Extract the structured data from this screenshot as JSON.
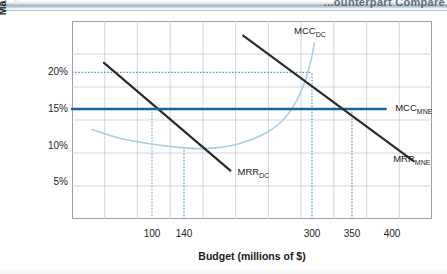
{
  "page": {
    "header_text": "...ounterpart Compare"
  },
  "chart_data": {
    "type": "line",
    "title": "",
    "xlabel": "Budget (millions of $)",
    "ylabel": "Marginal cost of capital\nand rate of return (percentage)",
    "xlim": [
      0,
      450
    ],
    "ylim": [
      0,
      27
    ],
    "grid": true,
    "legend_position": "inline-labels",
    "x_ticks": [
      {
        "label": "100",
        "value": 100
      },
      {
        "label": "140",
        "value": 140
      },
      {
        "label": "300",
        "value": 300
      },
      {
        "label": "350",
        "value": 350
      },
      {
        "label": "400",
        "value": 400
      }
    ],
    "y_ticks": [
      {
        "label": "20%",
        "value": 20
      },
      {
        "label": "15%",
        "value": 15
      },
      {
        "label": "10%",
        "value": 10
      },
      {
        "label": "5%",
        "value": 5
      }
    ],
    "series": [
      {
        "name": "MCC_DC",
        "label": "MCC",
        "label_sub": "DC",
        "type": "curve",
        "color": "#a9cfe4",
        "points": [
          [
            25,
            12.2
          ],
          [
            60,
            11.0
          ],
          [
            95,
            10.3
          ],
          [
            130,
            9.8
          ],
          [
            155,
            9.6
          ],
          [
            180,
            9.7
          ],
          [
            210,
            10.3
          ],
          [
            240,
            11.6
          ],
          [
            262,
            13.3
          ],
          [
            278,
            15.6
          ],
          [
            290,
            18.4
          ],
          [
            298,
            21.3
          ],
          [
            303,
            24.0
          ]
        ]
      },
      {
        "name": "MRR_DC",
        "label": "MRR",
        "label_sub": "DC",
        "type": "line",
        "color": "#2b2b2b",
        "points": [
          [
            40,
            21.3
          ],
          [
            198,
            6.6
          ]
        ]
      },
      {
        "name": "MCC_MNE",
        "label": "MCC",
        "label_sub": "MNE",
        "type": "line",
        "color": "#1267a0",
        "points": [
          [
            0,
            15.0
          ],
          [
            392,
            15.0
          ]
        ]
      },
      {
        "name": "MRR_MNE",
        "label": "MRR",
        "label_sub": "MNE",
        "type": "line",
        "color": "#2b2b2b",
        "points": [
          [
            214,
            25.0
          ],
          [
            427,
            7.9
          ]
        ]
      }
    ],
    "guides": [
      {
        "name": "guide-20pct-horizontal",
        "orientation": "horizontal",
        "value": 20,
        "from": 0,
        "to": 300,
        "color": "#5a9dc4"
      },
      {
        "name": "guide-15pct-horizontal",
        "orientation": "horizontal",
        "value": 15,
        "from": 0,
        "to": 100,
        "color": "#2b6f9e"
      },
      {
        "name": "guide-300-vertical",
        "orientation": "vertical",
        "value": 300,
        "from": 0,
        "to": 20,
        "color": "#5a9dc4"
      },
      {
        "name": "guide-350-vertical",
        "orientation": "vertical",
        "value": 350,
        "from": 0,
        "to": 15,
        "color": "#5a9dc4"
      },
      {
        "name": "guide-100-vertical",
        "orientation": "vertical",
        "value": 100,
        "from": 0,
        "to": 15,
        "color": "#7fb3d0"
      },
      {
        "name": "guide-140-vertical",
        "orientation": "vertical",
        "value": 140,
        "from": 0,
        "to": 9.7,
        "color": "#5a9dc4"
      }
    ],
    "annotations": [
      {
        "name": "label-mcc-dc",
        "text": "MCC",
        "sub": "DC",
        "x": 300,
        "y": 25.6
      },
      {
        "name": "label-mcc-mne",
        "text": "MCC",
        "sub": "MNE",
        "x": 404,
        "y": 15.0
      },
      {
        "name": "label-mrr-dc",
        "text": "MRR",
        "sub": "DC",
        "x": 207,
        "y": 6.3
      },
      {
        "name": "label-mrr-mne",
        "text": "MRR",
        "sub": "MNE",
        "x": 424,
        "y": 8.0
      }
    ],
    "intersections": [
      {
        "name": "equilibrium-dc",
        "x": 300,
        "y": 20,
        "note": "MCC_DC meets MRR_DC"
      },
      {
        "name": "equilibrium-mne",
        "x": 350,
        "y": 15,
        "note": "MCC_MNE meets MRR_MNE"
      },
      {
        "name": "mrr-dc-meets-mcc-mne",
        "x": 100,
        "y": 15
      }
    ]
  }
}
